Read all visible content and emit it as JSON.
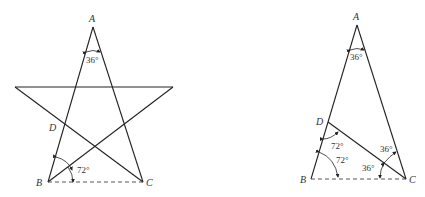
{
  "left_figure": {
    "description": "Pentagram with apex A, base vertices B and C, D on AB",
    "labels": {
      "A": "A",
      "B": "B",
      "C": "C",
      "D": "D"
    },
    "angles": {
      "apex": "36°",
      "base_B": "72°"
    }
  },
  "right_figure": {
    "description": "Golden triangle ABC with bisector CD",
    "labels": {
      "A": "A",
      "B": "B",
      "C": "C",
      "D": "D"
    },
    "angles": {
      "apex": "36°",
      "at_D": "72°",
      "at_B": "72°",
      "at_C_upper": "36°",
      "at_C_lower": "36°"
    }
  }
}
